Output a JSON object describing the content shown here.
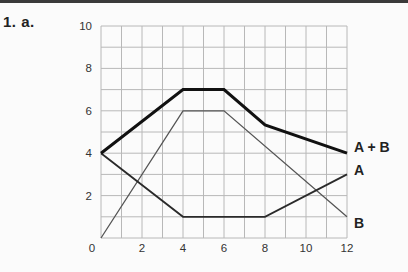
{
  "problem": {
    "label": "1.  a."
  },
  "chart_data": {
    "type": "line",
    "title": "",
    "xlabel": "",
    "ylabel": "",
    "xlim": [
      0,
      12
    ],
    "ylim": [
      0,
      10
    ],
    "grid": true,
    "x_ticks": [
      0,
      2,
      4,
      6,
      8,
      10,
      12
    ],
    "y_ticks": [
      0,
      2,
      4,
      6,
      8,
      10
    ],
    "x_tick_labels": [
      "0",
      "2",
      "4",
      "6",
      "8",
      "10",
      "12"
    ],
    "y_tick_labels": [
      "0",
      "2",
      "4",
      "6",
      "8",
      "10"
    ],
    "legend_position": "end-of-line labels (right)",
    "series": [
      {
        "name": "A + B",
        "style": "thick",
        "color": "#111111",
        "points": [
          [
            0,
            4
          ],
          [
            4,
            7
          ],
          [
            6,
            7
          ],
          [
            8,
            5.33
          ],
          [
            12,
            4
          ]
        ]
      },
      {
        "name": "A",
        "style": "medium",
        "color": "#2a2a2a",
        "points": [
          [
            0,
            4
          ],
          [
            4,
            1
          ],
          [
            8,
            1
          ],
          [
            12,
            3
          ]
        ]
      },
      {
        "name": "B",
        "style": "thin",
        "color": "#555555",
        "points": [
          [
            0,
            0
          ],
          [
            4,
            6
          ],
          [
            6,
            6
          ],
          [
            12,
            1
          ]
        ]
      }
    ]
  },
  "colors": {
    "background": "#fbfbfb",
    "grid": "#b8b8b8",
    "topbar": "#3a3a3a"
  }
}
